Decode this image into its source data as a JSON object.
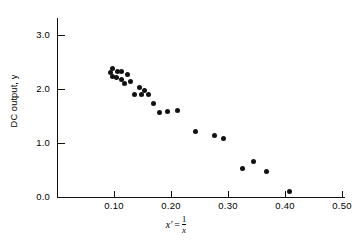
{
  "chart_data": {
    "type": "scatter",
    "title": "",
    "xlabel": "x' = 1/x",
    "ylabel": "DC output, y",
    "xlim": [
      0.0,
      0.555
    ],
    "ylim": [
      0.0,
      3.35
    ],
    "grid": false,
    "legend": null,
    "x_ticks": [
      "0.10",
      "0.20",
      "0.30",
      "0.40",
      "0.50"
    ],
    "x_tick_values": [
      0.1,
      0.2,
      0.3,
      0.4,
      0.5
    ],
    "y_ticks": [
      "0.0",
      "1.0",
      "2.0",
      "3.0"
    ],
    "y_tick_values": [
      0.0,
      1.0,
      2.0,
      3.0
    ],
    "marker": "filled-circle",
    "marker_color": "#111111",
    "points": [
      {
        "x": 0.093,
        "y": 2.3
      },
      {
        "x": 0.098,
        "y": 2.38
      },
      {
        "x": 0.098,
        "y": 2.24
      },
      {
        "x": 0.105,
        "y": 2.22
      },
      {
        "x": 0.107,
        "y": 2.33
      },
      {
        "x": 0.113,
        "y": 2.33
      },
      {
        "x": 0.113,
        "y": 2.17
      },
      {
        "x": 0.119,
        "y": 2.11
      },
      {
        "x": 0.124,
        "y": 2.26
      },
      {
        "x": 0.129,
        "y": 2.13
      },
      {
        "x": 0.136,
        "y": 1.9
      },
      {
        "x": 0.144,
        "y": 2.02
      },
      {
        "x": 0.149,
        "y": 1.89
      },
      {
        "x": 0.153,
        "y": 1.97
      },
      {
        "x": 0.161,
        "y": 1.9
      },
      {
        "x": 0.169,
        "y": 1.74
      },
      {
        "x": 0.18,
        "y": 1.56
      },
      {
        "x": 0.194,
        "y": 1.59
      },
      {
        "x": 0.212,
        "y": 1.61
      },
      {
        "x": 0.243,
        "y": 1.21
      },
      {
        "x": 0.277,
        "y": 1.13
      },
      {
        "x": 0.292,
        "y": 1.08
      },
      {
        "x": 0.325,
        "y": 0.53
      },
      {
        "x": 0.344,
        "y": 0.65
      },
      {
        "x": 0.367,
        "y": 0.48
      },
      {
        "x": 0.408,
        "y": 0.1
      }
    ],
    "n_points": 26
  },
  "axis_titles": {
    "y": "DC output, y",
    "x_lhs": "x'",
    "x_eq": "=",
    "x_numerator": "1",
    "x_denominator": "x"
  }
}
